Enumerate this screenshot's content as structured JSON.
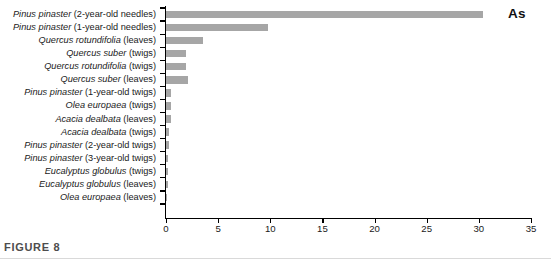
{
  "figure": {
    "caption": "FIGURE 8",
    "series_annotation": "As"
  },
  "chart_data": {
    "type": "bar",
    "orientation": "horizontal",
    "title": "",
    "xlabel": "",
    "ylabel": "",
    "xlim": [
      0,
      35
    ],
    "xticks": [
      0,
      5,
      10,
      15,
      20,
      25,
      30,
      35
    ],
    "xtick_labels": [
      "0",
      "5",
      "10",
      "15",
      "20",
      "25",
      "30",
      "35"
    ],
    "grid": false,
    "legend": null,
    "bar_color": "#a6a6a6",
    "axis_color": "#000000",
    "series": [
      {
        "name": "As",
        "values": [
          30.4,
          9.8,
          3.5,
          1.9,
          1.9,
          2.1,
          0.5,
          0.5,
          0.5,
          0.25,
          0.25,
          0.2,
          0.2,
          0.2,
          0.1
        ]
      }
    ],
    "categories": [
      "Pinus pinaster (2-year-old needles)",
      "Pinus pinaster (1-year-old needles)",
      "Quercus rotundifolia (leaves)",
      "Quercus suber (twigs)",
      "Quercus rotundifolia (twigs)",
      "Quercus suber (leaves)",
      "Pinus pinaster (1-year-old twigs)",
      "Olea europaea (twigs)",
      "Acacia dealbata (leaves)",
      "Acacia dealbata (twigs)",
      "Pinus pinaster (2-year-old twigs)",
      "Pinus pinaster (3-year-old twigs)",
      "Eucalyptus globulus (twigs)",
      "Eucalyptus globulus (leaves)",
      "Olea europaea (leaves)"
    ],
    "category_parts": [
      {
        "species": "Pinus pinaster",
        "tissue": " (2-year-old needles)"
      },
      {
        "species": "Pinus pinaster",
        "tissue": " (1-year-old needles)"
      },
      {
        "species": "Quercus rotundifolia",
        "tissue": " (leaves)"
      },
      {
        "species": "Quercus suber",
        "tissue": " (twigs)"
      },
      {
        "species": "Quercus rotundifolia",
        "tissue": " (twigs)"
      },
      {
        "species": "Quercus suber",
        "tissue": " (leaves)"
      },
      {
        "species": "Pinus pinaster",
        "tissue": " (1-year-old twigs)"
      },
      {
        "species": "Olea europaea",
        "tissue": " (twigs)"
      },
      {
        "species": "Acacia dealbata",
        "tissue": " (leaves)"
      },
      {
        "species": "Acacia dealbata",
        "tissue": " (twigs)"
      },
      {
        "species": "Pinus pinaster",
        "tissue": " (2-year-old twigs)"
      },
      {
        "species": "Pinus pinaster",
        "tissue": " (3-year-old twigs)"
      },
      {
        "species": "Eucalyptus globulus",
        "tissue": " (twigs)"
      },
      {
        "species": "Eucalyptus globulus",
        "tissue": " (leaves)"
      },
      {
        "species": "Olea europaea",
        "tissue": " (leaves)"
      }
    ]
  }
}
